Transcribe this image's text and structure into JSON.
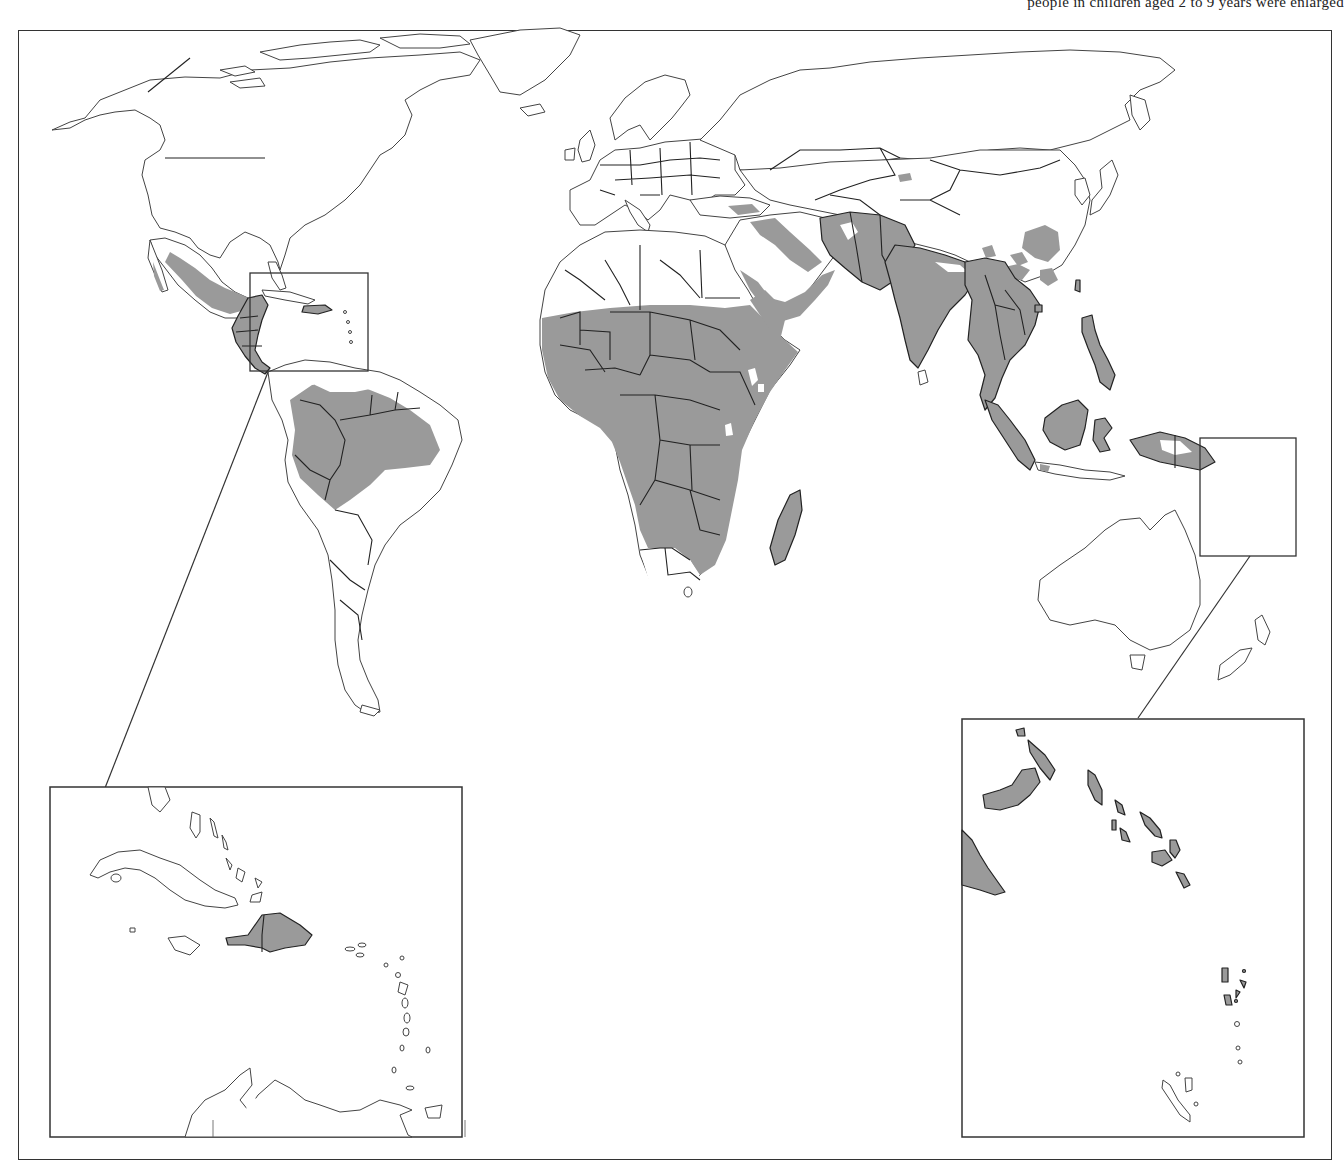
{
  "caption": {
    "partial_text": "people in children aged 2 to 9 years were enlarged",
    "clipped": true
  },
  "map": {
    "title": "",
    "projection": "world, Pacific-cut equirectangular-like",
    "colors": {
      "background": "#ffffff",
      "land": "#ffffff",
      "endemic_fill": "#9a9a9a",
      "outline": "#444444",
      "border": "#222222"
    },
    "shaded_regions": [
      "Western Mexico",
      "Central America",
      "Hispaniola (Haiti, Dominican Republic)",
      "Northern South America / Amazon basin",
      "Sub-Saharan Africa (Sahel to northern South Africa)",
      "Madagascar",
      "Arabian Peninsula (southwest and Yemen/Oman coast)",
      "Iraq / Iran / Afghanistan / Pakistan",
      "India, Bangladesh, Nepal lowlands",
      "Southeast Asia (Myanmar, Thailand, Laos, Cambodia, Vietnam)",
      "Southern and central China (patchy)",
      "Philippines",
      "Indonesia, Malaysia (Borneo, Sumatra, Sulawesi)",
      "Papua New Guinea",
      "Solomon Islands",
      "Vanuatu"
    ],
    "insets": [
      {
        "name": "Caribbean inset",
        "shaded": [
          "Haiti",
          "Dominican Republic"
        ],
        "unshaded": [
          "Cuba",
          "Jamaica",
          "Bahamas",
          "Lesser Antilles",
          "Venezuela coast"
        ]
      },
      {
        "name": "Southwest Pacific inset",
        "shaded": [
          "New Britain / New Ireland",
          "Papua New Guinea east tip",
          "Solomon Islands",
          "Vanuatu"
        ],
        "unshaded": [
          "New Caledonia",
          "Loyalty Islands"
        ]
      }
    ]
  }
}
